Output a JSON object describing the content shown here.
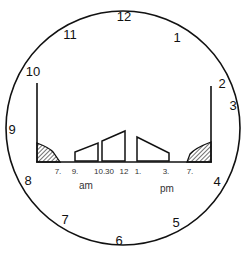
{
  "diagram": {
    "type": "clock-face-activity-chart",
    "clock_numbers": [
      {
        "label": "12",
        "x": 124,
        "y": 21
      },
      {
        "label": "1",
        "x": 177,
        "y": 40
      },
      {
        "label": "2",
        "x": 219,
        "y": 88
      },
      {
        "label": "3",
        "x": 234,
        "y": 110
      },
      {
        "label": "4",
        "x": 217,
        "y": 187
      },
      {
        "label": "5",
        "x": 176,
        "y": 227
      },
      {
        "label": "6",
        "x": 119,
        "y": 246
      },
      {
        "label": "7",
        "x": 65,
        "y": 222
      },
      {
        "label": "8",
        "x": 28,
        "y": 186
      },
      {
        "label": "9",
        "x": 12,
        "y": 134
      },
      {
        "label": "10",
        "x": 33,
        "y": 75
      },
      {
        "label": "11",
        "x": 70,
        "y": 38
      }
    ],
    "time_ticks": [
      {
        "label": "7.",
        "x": 58
      },
      {
        "label": "9.",
        "x": 74
      },
      {
        "label": "10.30",
        "x": 103
      },
      {
        "label": "12",
        "x": 123
      },
      {
        "label": "1.",
        "x": 137
      },
      {
        "label": "3.",
        "x": 164
      },
      {
        "label": "7.",
        "x": 189
      }
    ],
    "am_label": "am",
    "pm_label": "pm",
    "segments": [
      {
        "name": "morning-dark",
        "start": "edge",
        "end": "7 am",
        "style": "hatched"
      },
      {
        "name": "morning-block",
        "start": "9 am",
        "end": "10.30 am",
        "style": "rising-trapezoid"
      },
      {
        "name": "midday-block",
        "start": "10.30 am",
        "end": "12",
        "style": "rising-trapezoid"
      },
      {
        "name": "afternoon-block",
        "start": "1 pm",
        "end": "3 pm",
        "style": "falling-trapezoid"
      },
      {
        "name": "evening-dark",
        "start": "7 pm",
        "end": "edge",
        "style": "hatched"
      }
    ],
    "colors": {
      "stroke": "#111111",
      "background": "#ffffff"
    }
  }
}
